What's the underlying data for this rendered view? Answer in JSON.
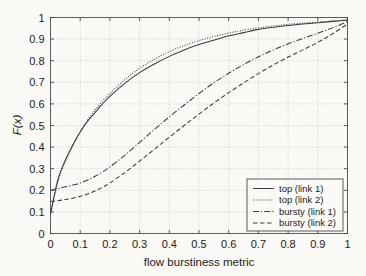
{
  "chart_data": {
    "type": "line",
    "title": "",
    "xlabel": "flow burstiness metric",
    "ylabel": "F(x)",
    "xlim": [
      0,
      1
    ],
    "ylim": [
      0,
      1
    ],
    "grid": true,
    "legend_position": "lower right",
    "xticks": [
      "0",
      "0.1",
      "0.2",
      "0.3",
      "0.4",
      "0.5",
      "0.6",
      "0.7",
      "0.8",
      "0.9",
      "1"
    ],
    "xtick_values": [
      0,
      0.1,
      0.2,
      0.3,
      0.4,
      0.5,
      0.6,
      0.7,
      0.8,
      0.9,
      1
    ],
    "yticks": [
      "0",
      "0.1",
      "0.2",
      "0.3",
      "0.4",
      "0.5",
      "0.6",
      "0.7",
      "0.8",
      "0.9",
      "1"
    ],
    "ytick_values": [
      0,
      0.1,
      0.2,
      0.3,
      0.4,
      0.5,
      0.6,
      0.7,
      0.8,
      0.9,
      1
    ],
    "x": [
      0,
      0.025,
      0.05,
      0.075,
      0.1,
      0.125,
      0.15,
      0.175,
      0.2,
      0.25,
      0.3,
      0.35,
      0.4,
      0.45,
      0.5,
      0.55,
      0.6,
      0.65,
      0.7,
      0.75,
      0.8,
      0.85,
      0.9,
      0.95,
      1
    ],
    "series": [
      {
        "name": "top (link 1)",
        "linestyle": "solid",
        "dasharray": "",
        "values": [
          0.09,
          0.25,
          0.34,
          0.41,
          0.47,
          0.52,
          0.56,
          0.6,
          0.635,
          0.695,
          0.745,
          0.785,
          0.82,
          0.85,
          0.875,
          0.895,
          0.915,
          0.93,
          0.945,
          0.955,
          0.963,
          0.97,
          0.976,
          0.982,
          0.988
        ]
      },
      {
        "name": "top (link 2)",
        "linestyle": "dotted",
        "dasharray": "1 1.6",
        "values": [
          0.09,
          0.24,
          0.33,
          0.405,
          0.47,
          0.525,
          0.572,
          0.612,
          0.648,
          0.712,
          0.765,
          0.807,
          0.842,
          0.87,
          0.893,
          0.912,
          0.928,
          0.941,
          0.952,
          0.961,
          0.968,
          0.974,
          0.979,
          0.984,
          0.99
        ]
      },
      {
        "name": "bursty (link 1)",
        "linestyle": "dashdot",
        "dasharray": "6 2 1.2 2",
        "values": [
          0.2,
          0.208,
          0.216,
          0.224,
          0.234,
          0.248,
          0.265,
          0.285,
          0.308,
          0.362,
          0.422,
          0.482,
          0.54,
          0.595,
          0.648,
          0.698,
          0.742,
          0.782,
          0.818,
          0.85,
          0.878,
          0.903,
          0.927,
          0.952,
          0.982
        ]
      },
      {
        "name": "bursty (link 2)",
        "linestyle": "dashed",
        "dasharray": "4.5 2.5",
        "values": [
          0.148,
          0.152,
          0.157,
          0.163,
          0.172,
          0.183,
          0.197,
          0.214,
          0.234,
          0.282,
          0.335,
          0.39,
          0.446,
          0.5,
          0.553,
          0.604,
          0.652,
          0.697,
          0.74,
          0.78,
          0.817,
          0.85,
          0.885,
          0.925,
          0.97
        ]
      }
    ]
  },
  "figure": {
    "background_color": "#faf9f6",
    "axis_color": "#4a4a4a",
    "grid_color": "#b9b9b9",
    "curve_color": "#3c3c3c"
  }
}
